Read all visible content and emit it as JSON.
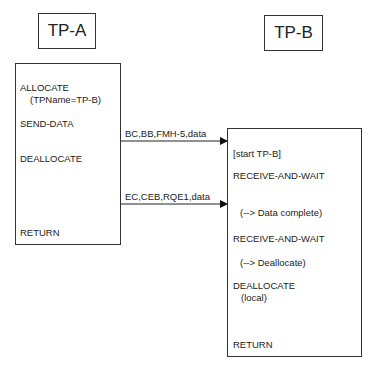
{
  "diagram": {
    "type": "sequence",
    "programs": [
      {
        "name": "TP-A",
        "steps": [
          "ALLOCATE",
          "(TPName=TP-B)",
          "SEND-DATA",
          "DEALLOCATE",
          "RETURN"
        ]
      },
      {
        "name": "TP-B",
        "steps": [
          "[start TP-B]",
          "RECEIVE-AND-WAIT",
          "(--> Data complete)",
          "RECEIVE-AND-WAIT",
          "(--> Deallocate)",
          "DEALLOCATE",
          "(local)",
          "RETURN"
        ]
      }
    ],
    "messages": [
      {
        "from": "TP-A",
        "to": "TP-B",
        "label": "BC,BB,FMH-5,data"
      },
      {
        "from": "TP-A",
        "to": "TP-B",
        "label": "EC,CEB,RQE1,data"
      }
    ]
  }
}
